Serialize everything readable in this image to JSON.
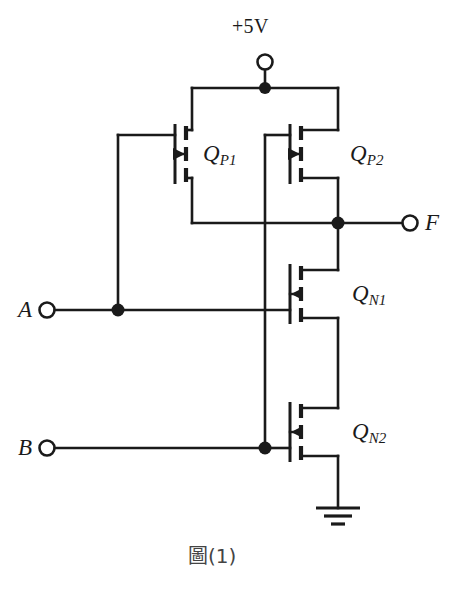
{
  "figure": {
    "caption": "圖(1)",
    "kind": "cmos-logic-gate-schematic"
  },
  "supply": {
    "label": "+5V",
    "terminal_icon": "open-terminal-circle"
  },
  "ground": {
    "icon": "ground-symbol",
    "bars": 3
  },
  "ports": [
    {
      "id": "A",
      "label": "A",
      "role": "input",
      "terminal_icon": "open-terminal-circle"
    },
    {
      "id": "B",
      "label": "B",
      "role": "input",
      "terminal_icon": "open-terminal-circle"
    },
    {
      "id": "F",
      "label": "F",
      "role": "output",
      "terminal_icon": "open-terminal-circle"
    }
  ],
  "devices": [
    {
      "id": "QP1",
      "name": "Q",
      "subscript": "P1",
      "type": "PMOS",
      "arrow": "pointing-right",
      "gate_net": "A",
      "source_net": "+5V",
      "drain_net": "F"
    },
    {
      "id": "QP2",
      "name": "Q",
      "subscript": "P2",
      "type": "PMOS",
      "arrow": "pointing-right",
      "gate_net": "B",
      "source_net": "+5V",
      "drain_net": "F"
    },
    {
      "id": "QN1",
      "name": "Q",
      "subscript": "N1",
      "type": "NMOS",
      "arrow": "pointing-left",
      "gate_net": "A",
      "drain_net": "F",
      "source_net": "QN2-drain"
    },
    {
      "id": "QN2",
      "name": "Q",
      "subscript": "N2",
      "type": "NMOS",
      "arrow": "pointing-left",
      "gate_net": "B",
      "drain_net": "QN1-source",
      "source_net": "GND"
    }
  ],
  "junctions": [
    {
      "id": "vdd-rail-node",
      "net": "+5V"
    },
    {
      "id": "f-output-node",
      "net": "F"
    },
    {
      "id": "a-input-node",
      "net": "A"
    },
    {
      "id": "b-input-node",
      "net": "B"
    }
  ],
  "crossings": [
    {
      "id": "b-gate-over-f",
      "connected": false
    },
    {
      "id": "b-gate-over-a",
      "connected": false
    }
  ],
  "colors": {
    "ink": "#1a1a1a",
    "background": "#ffffff",
    "caption": "#444444"
  }
}
